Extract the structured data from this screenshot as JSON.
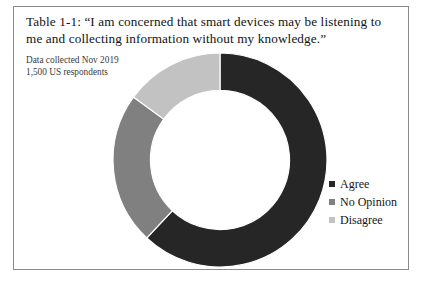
{
  "figure": {
    "title": "Table 1-1: “I am concerned that smart devices may be listening to me and collecting information without my knowledge.”",
    "note_line_1": "Data collected Nov 2019",
    "note_line_2": "1,500 US respondents",
    "border_color": "#8a8a8a",
    "background": "#ffffff"
  },
  "chart_data": {
    "type": "pie",
    "variant": "donut",
    "title": "Table 1-1: “I am concerned that smart devices may be listening to me and collecting information without my knowledge.”",
    "subtitle": "Data collected Nov 2019 / 1,500 US respondents",
    "categories": [
      "Agree",
      "No Opinion",
      "Disagree"
    ],
    "values": [
      62,
      23,
      15
    ],
    "value_unit": "percent",
    "colors": [
      "#262626",
      "#808080",
      "#c2c2c2"
    ],
    "start_angle_deg": 0,
    "direction": "clockwise",
    "hole_ratio": 0.65,
    "legend_position": "right",
    "data_labels": false,
    "grid": false
  },
  "legend": {
    "items": [
      {
        "label": "Agree",
        "color": "#262626"
      },
      {
        "label": "No Opinion",
        "color": "#808080"
      },
      {
        "label": "Disagree",
        "color": "#c2c2c2"
      }
    ]
  }
}
